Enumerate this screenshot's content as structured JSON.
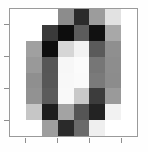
{
  "figure": {
    "title": "",
    "background_color": "#fefefe",
    "axes_background_color": "#ffffff",
    "spine_color": "#9a9a9a",
    "tick_color": "#8e8e8e"
  },
  "chart_data": {
    "type": "heatmap",
    "title": "",
    "xlabel": "",
    "ylabel": "",
    "colormap": "gray_r",
    "grid": false,
    "legend": "none",
    "xlim": [
      -0.5,
      7.5
    ],
    "ylim": [
      7.5,
      -0.5
    ],
    "x_tick_labels": [],
    "y_tick_labels": [],
    "x_tick_positions": [
      0,
      2,
      4,
      6
    ],
    "y_tick_positions": [
      0,
      2,
      4,
      6
    ],
    "rows": 8,
    "cols": 8,
    "vmin": 0,
    "vmax": 16,
    "values": [
      [
        0,
        0,
        0,
        7,
        14,
        6,
        1,
        0
      ],
      [
        0,
        0,
        5,
        15,
        10,
        15,
        4,
        0
      ],
      [
        0,
        6,
        15,
        3,
        1,
        11,
        6,
        0
      ],
      [
        0,
        7,
        12,
        0,
        0,
        8,
        7,
        0
      ],
      [
        0,
        7,
        12,
        0,
        0,
        8,
        7,
        0
      ],
      [
        0,
        7,
        11,
        0,
        3,
        13,
        6,
        0
      ],
      [
        0,
        3,
        15,
        6,
        11,
        15,
        1,
        0
      ],
      [
        0,
        0,
        6,
        14,
        10,
        1,
        0,
        0
      ]
    ],
    "colors": [
      [
        "#ffffff",
        "#ffffff",
        "#ffffff",
        "#8c8c8c",
        "#2b2b2b",
        "#9c9c9c",
        "#e2e2e2",
        "#ffffff"
      ],
      [
        "#ffffff",
        "#ffffff",
        "#3a3a3a",
        "#0d0d0d",
        "#5c5c5c",
        "#111111",
        "#a8a8a8",
        "#ffffff"
      ],
      [
        "#ffffff",
        "#a0a0a0",
        "#0e0e0e",
        "#d6d6d6",
        "#f2f2f2",
        "#5a5a5a",
        "#8f8f8f",
        "#ffffff"
      ],
      [
        "#ffffff",
        "#999999",
        "#565656",
        "#f7f7f7",
        "#fbfbfb",
        "#767676",
        "#8d8d8d",
        "#ffffff"
      ],
      [
        "#ffffff",
        "#8f8f8f",
        "#575757",
        "#f8f8f8",
        "#fafafa",
        "#7a7a7a",
        "#8c8c8c",
        "#ffffff"
      ],
      [
        "#ffffff",
        "#929292",
        "#5b5b5b",
        "#f9f9f9",
        "#c9c9c9",
        "#3c3c3c",
        "#9a9a9a",
        "#ffffff"
      ],
      [
        "#ffffff",
        "#c6c6c6",
        "#1d1d1d",
        "#a3a3a3",
        "#555555",
        "#232323",
        "#f2f2f2",
        "#ffffff"
      ],
      [
        "#ffffff",
        "#ffffff",
        "#9e9e9e",
        "#2a2a2a",
        "#6a6a6a",
        "#efefef",
        "#ffffff",
        "#ffffff"
      ]
    ]
  }
}
